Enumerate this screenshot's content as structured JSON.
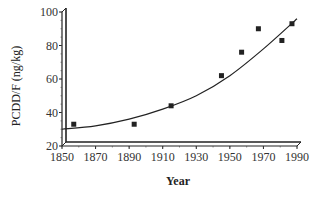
{
  "chart_data": {
    "type": "scatter",
    "title": "",
    "xlabel": "Year",
    "ylabel": "PCDD/F (ng/kg)",
    "xlim": [
      1850,
      1990
    ],
    "ylim": [
      20,
      100
    ],
    "x_ticks": [
      "1850",
      "1870",
      "1890",
      "1910",
      "1930",
      "1950",
      "1970",
      "1990"
    ],
    "y_ticks": [
      "20",
      "40",
      "60",
      "80",
      "100"
    ],
    "grid": false,
    "legend": "none",
    "series": [
      {
        "name": "measured",
        "kind": "scatter",
        "marker": "square",
        "x": [
          1857,
          1893,
          1915,
          1945,
          1957,
          1967,
          1981,
          1987
        ],
        "y": [
          33,
          33,
          44,
          62,
          76,
          90,
          83,
          93
        ]
      },
      {
        "name": "fit",
        "kind": "line",
        "x": [
          1850,
          1870,
          1890,
          1910,
          1930,
          1950,
          1970,
          1990
        ],
        "y": [
          30,
          32,
          36,
          42,
          50,
          62,
          78,
          96
        ]
      }
    ]
  }
}
